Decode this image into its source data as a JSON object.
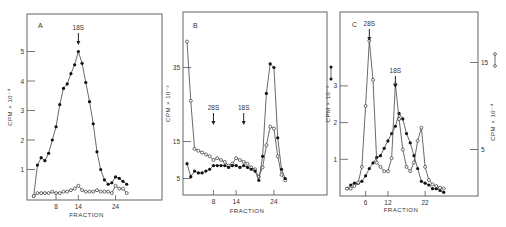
{
  "figure": {
    "panels": [
      "A",
      "B",
      "C"
    ]
  },
  "chart_data": [
    {
      "panel": "A",
      "type": "line",
      "xlabel": "FRACTION",
      "ylabel": "CPM × 10⁻⁴",
      "x_ticks": [
        8,
        14,
        24
      ],
      "y_ticks": [
        1,
        2,
        3,
        4,
        5
      ],
      "annotations": [
        {
          "text": "18S",
          "x": 14
        }
      ],
      "series": [
        {
          "name": "filled circles",
          "marker": "filled",
          "x": [
            2,
            3,
            4,
            5,
            6,
            7,
            8,
            9,
            10,
            11,
            12,
            13,
            14,
            15,
            16,
            17,
            18,
            19,
            20,
            21,
            22,
            23,
            24,
            25,
            26,
            27
          ],
          "y": [
            0.1,
            1.15,
            1.4,
            1.3,
            1.55,
            2.0,
            2.45,
            3.2,
            3.75,
            3.9,
            4.25,
            4.55,
            5.0,
            4.6,
            3.95,
            3.3,
            2.55,
            1.6,
            1.0,
            0.65,
            0.5,
            0.55,
            0.75,
            0.7,
            0.6,
            0.5
          ]
        },
        {
          "name": "open circles",
          "marker": "open",
          "x": [
            2,
            3,
            4,
            5,
            6,
            7,
            8,
            9,
            10,
            11,
            12,
            13,
            14,
            15,
            16,
            17,
            18,
            19,
            20,
            21,
            22,
            23,
            24,
            25,
            26,
            27
          ],
          "y": [
            0.1,
            0.2,
            0.2,
            0.2,
            0.2,
            0.25,
            0.2,
            0.2,
            0.25,
            0.25,
            0.3,
            0.35,
            0.45,
            0.3,
            0.25,
            0.25,
            0.25,
            0.3,
            0.25,
            0.25,
            0.25,
            0.2,
            0.45,
            0.35,
            0.35,
            0.2
          ]
        }
      ]
    },
    {
      "panel": "B",
      "type": "line",
      "xlabel": "FRACTION",
      "ylabel": "CPM × 10⁻³",
      "x_ticks": [
        8,
        14,
        24
      ],
      "y_ticks": [
        5,
        15,
        35
      ],
      "annotations": [
        {
          "text": "28S",
          "x": 8
        },
        {
          "text": "18S",
          "x": 16
        }
      ],
      "series": [
        {
          "name": "open circles",
          "marker": "open",
          "x": [
            1,
            2,
            3,
            4,
            5,
            6,
            7,
            8,
            9,
            10,
            11,
            12,
            13,
            14,
            15,
            16,
            17,
            18,
            19,
            20,
            21,
            22,
            23,
            24,
            25,
            26,
            27
          ],
          "y": [
            42,
            26,
            13,
            12.5,
            12,
            11.5,
            11,
            10,
            10.5,
            10,
            9.5,
            8.5,
            9,
            10.5,
            10,
            9.5,
            9,
            8,
            7.5,
            5.5,
            8,
            14,
            19,
            18.5,
            11,
            6,
            4.5
          ]
        },
        {
          "name": "filled circles",
          "marker": "filled",
          "x": [
            1,
            2,
            3,
            4,
            5,
            6,
            7,
            8,
            9,
            10,
            11,
            12,
            13,
            14,
            15,
            16,
            17,
            18,
            19,
            20,
            21,
            22,
            23,
            24,
            25,
            26,
            27
          ],
          "y": [
            9,
            5.5,
            7,
            6.5,
            6.5,
            7,
            7.5,
            8.5,
            8.5,
            8.5,
            8.5,
            8,
            8.5,
            8.5,
            8,
            8.5,
            8,
            7.5,
            7,
            4.5,
            11,
            28,
            36,
            35,
            16,
            7.5,
            5
          ]
        }
      ]
    },
    {
      "panel": "C",
      "type": "line",
      "xlabel": "FRACTION",
      "ylabel_left": "CPM × 10⁻³ (●—●)",
      "ylabel_right": "CPM × 10⁻⁴ (○—○)",
      "x_ticks": [
        6,
        12,
        22
      ],
      "y_ticks_left": [
        1,
        2,
        3
      ],
      "y_ticks_right": [
        5,
        15
      ],
      "annotations": [
        {
          "text": "28S",
          "x": 7
        },
        {
          "text": "18S",
          "x": 14
        }
      ],
      "series": [
        {
          "name": "filled circles",
          "axis": "left",
          "marker": "filled",
          "x": [
            1,
            2,
            3,
            4,
            5,
            6,
            7,
            8,
            9,
            10,
            11,
            12,
            13,
            14,
            15,
            16,
            17,
            18,
            19,
            20,
            21,
            22,
            23,
            24,
            25,
            26,
            27
          ],
          "y": [
            0.2,
            0.3,
            0.35,
            0.35,
            0.4,
            0.55,
            0.75,
            0.9,
            1.05,
            1.1,
            1.3,
            1.5,
            1.7,
            1.9,
            2.25,
            2.1,
            1.7,
            1.45,
            1.1,
            0.75,
            0.4,
            0.35,
            0.3,
            0.2,
            0.2,
            0.15,
            0.1
          ]
        },
        {
          "name": "open circles",
          "axis": "right",
          "marker": "open",
          "x": [
            1,
            2,
            3,
            4,
            5,
            6,
            7,
            8,
            9,
            10,
            11,
            12,
            13,
            14,
            15,
            16,
            17,
            18,
            19,
            20,
            21,
            22,
            23,
            24,
            25,
            26,
            27
          ],
          "y": [
            0.5,
            0.5,
            0.8,
            1.2,
            3.0,
            10.0,
            17.5,
            13.0,
            3.5,
            3.0,
            2.5,
            2.5,
            4.0,
            12.5,
            8.5,
            5.0,
            3.0,
            2.5,
            3.5,
            6.0,
            7.5,
            3.0,
            1.5,
            1.0,
            0.8,
            0.6,
            0.5
          ]
        }
      ]
    }
  ]
}
